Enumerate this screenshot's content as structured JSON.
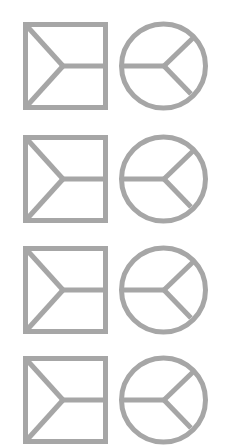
{
  "figure": {
    "background": "#ffffff",
    "stroke_color": "#a6a6a6",
    "stroke_width": 5,
    "rows": [
      {
        "index": 1,
        "top": 24,
        "left_shape": "square-with-y-split",
        "right_shape": "circle-with-y-split"
      },
      {
        "index": 2,
        "top": 137,
        "left_shape": "square-with-y-split",
        "right_shape": "circle-with-y-split"
      },
      {
        "index": 3,
        "top": 248,
        "left_shape": "square-with-y-split",
        "right_shape": "circle-with-y-split"
      },
      {
        "index": 4,
        "top": 358,
        "left_shape": "square-with-y-split",
        "right_shape": "circle-with-y-split"
      }
    ]
  }
}
